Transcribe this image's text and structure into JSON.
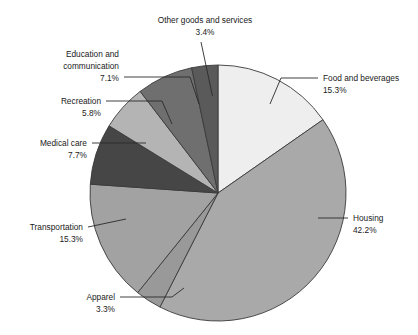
{
  "chart_data": {
    "type": "pie",
    "title": "",
    "subtitle": "",
    "xlabel": "",
    "ylabel": "",
    "legend_position": "none",
    "grid": false,
    "units": "percent",
    "categories": [
      "Food and beverages",
      "Housing",
      "Apparel",
      "Transportation",
      "Medical care",
      "Recreation",
      "Education and communication",
      "Other goods and services"
    ],
    "values": [
      15.3,
      42.2,
      3.3,
      15.3,
      7.7,
      5.8,
      7.1,
      3.4
    ],
    "slices": [
      {
        "name": "Food and beverages",
        "label_line1": "Food and beverages",
        "label_line2": "",
        "label_line3": "",
        "value_label": "15.3%",
        "value": 15.3,
        "color": "#eeeeee",
        "start_deg": 0,
        "end_deg": 55.08
      },
      {
        "name": "Housing",
        "label_line1": "Housing",
        "label_line2": "",
        "label_line3": "",
        "value_label": "42.2%",
        "value": 42.2,
        "color": "#a9a9a9",
        "start_deg": 55.08,
        "end_deg": 206.99
      },
      {
        "name": "Apparel",
        "label_line1": "Apparel",
        "label_line2": "",
        "label_line3": "",
        "value_label": "3.3%",
        "value": 3.3,
        "color": "#999999",
        "start_deg": 206.99,
        "end_deg": 218.87
      },
      {
        "name": "Transportation",
        "label_line1": "Transportation",
        "label_line2": "",
        "label_line3": "",
        "value_label": "15.3%",
        "value": 15.3,
        "color": "#a2a2a2",
        "start_deg": 218.87,
        "end_deg": 273.95
      },
      {
        "name": "Medical care",
        "label_line1": "Medical care",
        "label_line2": "",
        "label_line3": "",
        "value_label": "7.7%",
        "value": 7.7,
        "color": "#464646",
        "start_deg": 273.95,
        "end_deg": 301.67
      },
      {
        "name": "Recreation",
        "label_line1": "Recreation",
        "label_line2": "",
        "label_line3": "",
        "value_label": "5.8%",
        "value": 5.8,
        "color": "#b4b4b4",
        "start_deg": 301.67,
        "end_deg": 322.55
      },
      {
        "name": "Education and communication",
        "label_line1": "Education and",
        "label_line2": "communication",
        "label_line3": "",
        "value_label": "7.1%",
        "value": 7.1,
        "color": "#6f6f6f",
        "start_deg": 322.55,
        "end_deg": 348.11
      },
      {
        "name": "Other goods and services",
        "label_line1": "Other goods and services",
        "label_line2": "",
        "label_line3": "",
        "value_label": "3.4%",
        "value": 3.4,
        "color": "#5a5a5a",
        "start_deg": 348.11,
        "end_deg": 360
      }
    ]
  },
  "labels": {
    "other_goods": {
      "line1": "Other goods and services",
      "value": "3.4%"
    },
    "education": {
      "line1": "Education and",
      "line2": "communication",
      "value": "7.1%"
    },
    "recreation": {
      "line1": "Recreation",
      "value": "5.8%"
    },
    "medical": {
      "line1": "Medical care",
      "value": "7.7%"
    },
    "transportation": {
      "line1": "Transportation",
      "value": "15.3%"
    },
    "apparel": {
      "line1": "Apparel",
      "value": "3.3%"
    },
    "food": {
      "line1": "Food and beverages",
      "value": "15.3%"
    },
    "housing": {
      "line1": "Housing",
      "value": "42.2%"
    }
  },
  "colors": {
    "background": "#ffffff",
    "text": "#1a1a1a",
    "slice_border": "#3a3a3a",
    "leader_line": "#2a2a2a"
  }
}
